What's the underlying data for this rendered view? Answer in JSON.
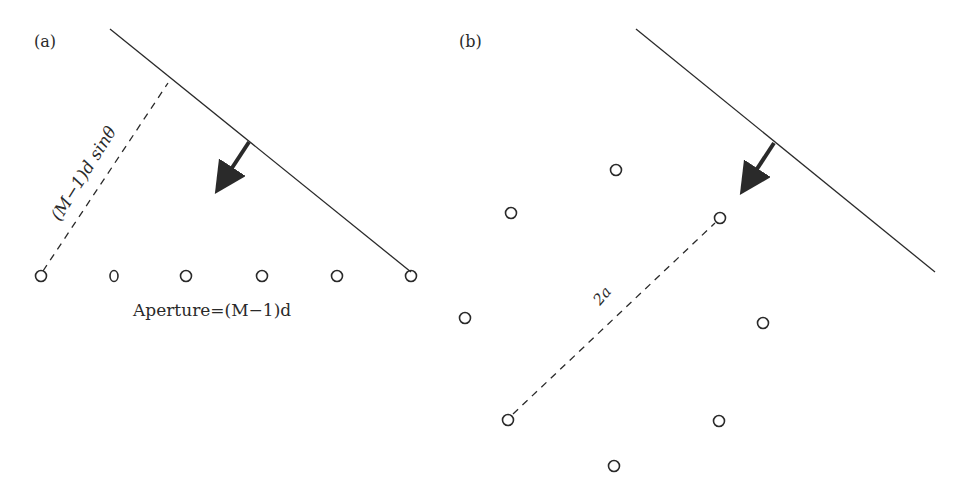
{
  "panel_a": {
    "label": "(a)",
    "wavefront_label": "",
    "path_label": "(M−1)d sinθ",
    "aperture_label": "Aperture=(M−1)d",
    "elements": [
      {
        "x": 41,
        "y": 276,
        "shape": "circle"
      },
      {
        "x": 114,
        "y": 276,
        "shape": "oval"
      },
      {
        "x": 186,
        "y": 276,
        "shape": "circle"
      },
      {
        "x": 262,
        "y": 276,
        "shape": "circle"
      },
      {
        "x": 337,
        "y": 276,
        "shape": "circle"
      },
      {
        "x": 411,
        "y": 276,
        "shape": "circle"
      }
    ]
  },
  "panel_b": {
    "label": "(b)",
    "diameter_label": "2a",
    "elements": [
      {
        "x": 616,
        "y": 170
      },
      {
        "x": 511,
        "y": 213
      },
      {
        "x": 720,
        "y": 218
      },
      {
        "x": 465,
        "y": 318
      },
      {
        "x": 763,
        "y": 323
      },
      {
        "x": 508,
        "y": 420
      },
      {
        "x": 719,
        "y": 421
      },
      {
        "x": 614,
        "y": 466
      }
    ]
  },
  "colors": {
    "ink": "#2a2a2a",
    "background": "#ffffff"
  }
}
